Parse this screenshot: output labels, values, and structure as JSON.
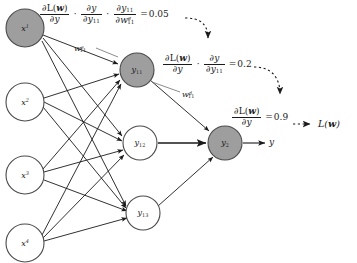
{
  "figure": {
    "type": "neural-network-backpropagation-diagram",
    "background_color": "#ffffff",
    "ink_color": "#1a1a1a",
    "highlight_fill": "#9e9e9e",
    "plain_fill": "#ffffff"
  },
  "layers": {
    "input": {
      "nodes": [
        {
          "id": "x1",
          "label": "x",
          "superscript": "1",
          "cx": 25,
          "cy": 28,
          "r": 19,
          "highlighted": true
        },
        {
          "id": "x2",
          "label": "x",
          "superscript": "2",
          "cx": 25,
          "cy": 102,
          "r": 19,
          "highlighted": false
        },
        {
          "id": "x3",
          "label": "x",
          "superscript": "3",
          "cx": 25,
          "cy": 175,
          "r": 19,
          "highlighted": false
        },
        {
          "id": "x4",
          "label": "x",
          "superscript": "4",
          "cx": 25,
          "cy": 243,
          "r": 19,
          "highlighted": false
        }
      ]
    },
    "hidden": {
      "nodes": [
        {
          "id": "y11",
          "label": "y",
          "subscript": "11",
          "cx": 137,
          "cy": 70,
          "r": 17,
          "highlighted": true
        },
        {
          "id": "y12",
          "label": "y",
          "subscript": "12",
          "cx": 140,
          "cy": 143,
          "r": 17,
          "highlighted": false
        },
        {
          "id": "y13",
          "label": "y",
          "subscript": "13",
          "cx": 143,
          "cy": 213,
          "r": 17,
          "highlighted": false
        }
      ]
    },
    "output": {
      "nodes": [
        {
          "id": "y2",
          "label": "y",
          "subscript": "2",
          "cx": 225,
          "cy": 143,
          "r": 17,
          "highlighted": true
        }
      ],
      "output_arrow_label": "y"
    }
  },
  "weights": [
    {
      "id": "w-x1-y11",
      "base": "w",
      "subscript": "11",
      "superscript": "e",
      "x": 74,
      "y": 44
    },
    {
      "id": "w-y11-y2",
      "base": "w",
      "subscript": "11",
      "superscript": "d",
      "x": 182,
      "y": 90
    }
  ],
  "gradients": [
    {
      "id": "grad-weight",
      "x": 40,
      "y": 4,
      "terms": [
        {
          "num_prefix": "∂L(",
          "num_bold": "w",
          "num_suffix": ")",
          "den": "∂y"
        },
        {
          "num": "∂y",
          "den_base": "∂y",
          "den_sub": "11"
        },
        {
          "num_base": "∂y",
          "num_sub": "11",
          "den_base": "∂w",
          "den_sub": "11",
          "den_sup": "e"
        }
      ],
      "value": "0.05",
      "equals": "="
    },
    {
      "id": "grad-hidden",
      "x": 163,
      "y": 54,
      "terms": [
        {
          "num_prefix": "∂L(",
          "num_bold": "w",
          "num_suffix": ")",
          "den": "∂y"
        },
        {
          "num": "∂y",
          "den_base": "∂y",
          "den_sub": "11"
        }
      ],
      "value": "0.2",
      "equals": "="
    },
    {
      "id": "grad-output",
      "x": 232,
      "y": 107,
      "terms": [
        {
          "num_prefix": "∂L(",
          "num_bold": "w",
          "num_suffix": ")",
          "den": "∂y"
        }
      ],
      "value": "0.9",
      "equals": "="
    }
  ],
  "loss": {
    "id": "loss-term",
    "label_prefix": "L(",
    "label_bold": "w",
    "label_suffix": ")",
    "x": 318,
    "y": 124
  },
  "edges": {
    "input_to_hidden_count": 12,
    "hidden_to_output_count": 3,
    "style": "solid-arrow"
  },
  "backprop_arrows": {
    "style": "dashed-curved-arrow",
    "direction": "right-to-left",
    "count": 3
  }
}
